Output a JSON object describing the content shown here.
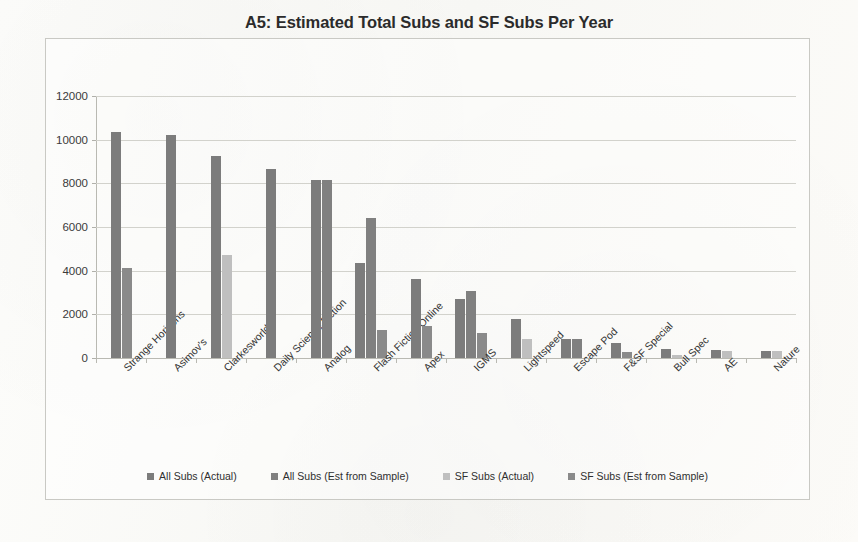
{
  "chart_data": {
    "type": "bar",
    "title": "A5: Estimated Total Subs and SF Subs Per Year",
    "xlabel": "",
    "ylabel": "",
    "ylim": [
      0,
      12000
    ],
    "ytick_labels": [
      "12000",
      "10000",
      "8000",
      "6000",
      "4000",
      "2000",
      "0"
    ],
    "yticks": [
      12000,
      10000,
      8000,
      6000,
      4000,
      2000,
      0
    ],
    "grid": true,
    "legend_position": "bottom",
    "categories": [
      "Strange Horizons",
      "Asimov's",
      "Clarkesworld",
      "Daily Science Fiction",
      "Analog",
      "Flash Fiction Online",
      "Apex",
      "IGMS",
      "Lightspeed",
      "Escape Pod",
      "F&SF Special",
      "Bull Spec",
      "AE",
      "Nature"
    ],
    "series": [
      {
        "name": "All Subs (Actual)",
        "color": "#7c7c7c",
        "values": [
          10350,
          10200,
          9250,
          8650,
          8150,
          4350,
          3600,
          2700,
          1800,
          880,
          700,
          400,
          350,
          340
        ]
      },
      {
        "name": "All Subs (Est from Sample)",
        "color": "#808080",
        "values": [
          null,
          null,
          null,
          null,
          8150,
          6400,
          null,
          3050,
          null,
          880,
          null,
          null,
          null,
          null
        ]
      },
      {
        "name": "SF Subs (Actual)",
        "color": "#bfbfbf",
        "values": [
          null,
          null,
          4700,
          null,
          null,
          null,
          null,
          null,
          850,
          null,
          null,
          130,
          330,
          330
        ]
      },
      {
        "name": "SF Subs (Est from Sample)",
        "color": "#8a8a8a",
        "values": [
          4100,
          null,
          null,
          null,
          null,
          1300,
          1450,
          1150,
          null,
          null,
          280,
          null,
          null,
          null
        ]
      }
    ]
  },
  "legend": {
    "items": [
      {
        "label": "All Subs (Actual)",
        "color": "#7c7c7c"
      },
      {
        "label": "All Subs (Est from Sample)",
        "color": "#808080"
      },
      {
        "label": "SF Subs (Actual)",
        "color": "#bfbfbf"
      },
      {
        "label": "SF Subs (Est from Sample)",
        "color": "#8a8a8a"
      }
    ]
  }
}
